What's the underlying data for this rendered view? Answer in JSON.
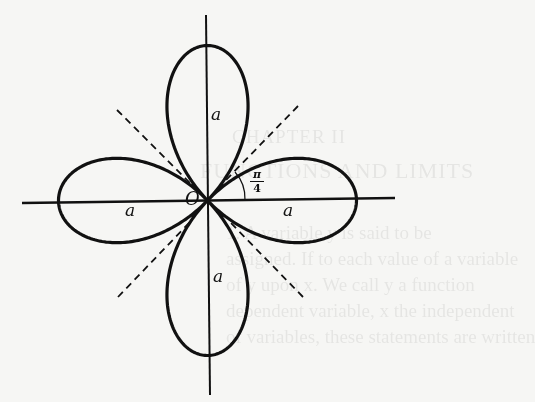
{
  "figure": {
    "curve": "r = a cos 2θ",
    "origin_label": "O",
    "leaf_labels": {
      "top": "a",
      "left": "a",
      "right": "a",
      "bottom": "a"
    },
    "angle_label": {
      "numerator": "π",
      "denominator": "4"
    },
    "dashed_lines": [
      "θ = π/4",
      "θ = 3π/4",
      "θ = 5π/4",
      "θ = 7π/4"
    ],
    "stroke_color": "#111111",
    "background_color": "#f6f6f4"
  },
  "bleed_through": {
    "chapter": "CHAPTER II",
    "title": "FUNCTIONS AND LIMITS",
    "lines": [
      "1. A variable y is said to be",
      "assigned. If to each value of a variable",
      "of y upon x. We call y a function",
      "dependent variable, x the independent",
      "of variables, these statements are written"
    ]
  }
}
